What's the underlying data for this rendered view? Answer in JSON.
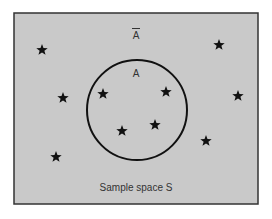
{
  "diagram": {
    "type": "venn",
    "sample_space_label": "Sample space S",
    "event_label": "A",
    "complement_label": "A",
    "complement_overbar": true,
    "colors": {
      "background": "#c9c9c9",
      "border": "#333333",
      "circle": "#111111",
      "star": "#111111",
      "text": "#333333"
    },
    "stars_inside_A": [
      {
        "x": 103,
        "y": 94
      },
      {
        "x": 166,
        "y": 92
      },
      {
        "x": 122,
        "y": 131
      },
      {
        "x": 155,
        "y": 125
      }
    ],
    "stars_outside_A": [
      {
        "x": 42,
        "y": 50
      },
      {
        "x": 219,
        "y": 45
      },
      {
        "x": 63,
        "y": 98
      },
      {
        "x": 238,
        "y": 96
      },
      {
        "x": 56,
        "y": 157
      },
      {
        "x": 206,
        "y": 141
      }
    ]
  }
}
